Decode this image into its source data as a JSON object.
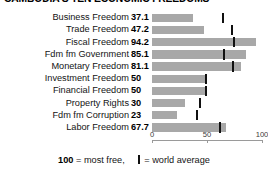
{
  "title": "CAMBODIA'S TEN ECONOMIC FREEDOMS",
  "legend": {
    "max_label": "100",
    "max_text": " = most free,",
    "avg_icon": "world-average-tick-icon",
    "avg_text": " = world average"
  },
  "axis": {
    "ticks": [
      "0",
      "50",
      "100"
    ]
  },
  "chart_data": {
    "type": "bar",
    "orientation": "horizontal",
    "title": "CAMBODIA'S TEN ECONOMIC FREEDOMS",
    "xlabel": "",
    "ylabel": "",
    "xlim": [
      0,
      100
    ],
    "grid": false,
    "legend_position": "bottom",
    "bar_color": "#a8a8a8",
    "marker_color": "#111111",
    "categories": [
      "Business Freedom",
      "Trade Freedom",
      "Fiscal Freedom",
      "Fdm fm Government",
      "Monetary Freedom",
      "Investment Freedom",
      "Financial Freedom",
      "Property Rights",
      "Fdm fm Corruption",
      "Labor Freedom"
    ],
    "values": [
      37.1,
      47.2,
      94.2,
      85.1,
      81.1,
      50,
      50,
      30,
      23,
      67.7
    ],
    "value_labels": [
      "37.1",
      "47.2",
      "94.2",
      "85.1",
      "81.1",
      "50",
      "50",
      "30",
      "23",
      "67.7"
    ],
    "world_average": [
      64.3,
      72.7,
      74.9,
      65.0,
      74.0,
      49.2,
      48.8,
      44.0,
      40.5,
      62.1
    ],
    "series": [
      {
        "name": "Cambodia score",
        "values": [
          37.1,
          47.2,
          94.2,
          85.1,
          81.1,
          50,
          50,
          30,
          23,
          67.7
        ]
      },
      {
        "name": "world average",
        "values": [
          64.3,
          72.7,
          74.9,
          65.0,
          74.0,
          49.2,
          48.8,
          44.0,
          40.5,
          62.1
        ]
      }
    ],
    "rows": [
      {
        "label": "Business Freedom",
        "value": "37.1",
        "score": 37.1,
        "avg": 64.3
      },
      {
        "label": "Trade Freedom",
        "value": "47.2",
        "score": 47.2,
        "avg": 72.7
      },
      {
        "label": "Fiscal Freedom",
        "value": "94.2",
        "score": 94.2,
        "avg": 74.9
      },
      {
        "label": "Fdm fm Government",
        "value": "85.1",
        "score": 85.1,
        "avg": 65.0
      },
      {
        "label": "Monetary Freedom",
        "value": "81.1",
        "score": 81.1,
        "avg": 74.0
      },
      {
        "label": "Investment Freedom",
        "value": "50",
        "score": 50.0,
        "avg": 49.2
      },
      {
        "label": "Financial Freedom",
        "value": "50",
        "score": 50.0,
        "avg": 48.8
      },
      {
        "label": "Property Rights",
        "value": "30",
        "score": 30.0,
        "avg": 44.0
      },
      {
        "label": "Fdm fm Corruption",
        "value": "23",
        "score": 23.0,
        "avg": 40.5
      },
      {
        "label": "Labor Freedom",
        "value": "67.7",
        "score": 67.7,
        "avg": 62.1
      }
    ]
  }
}
